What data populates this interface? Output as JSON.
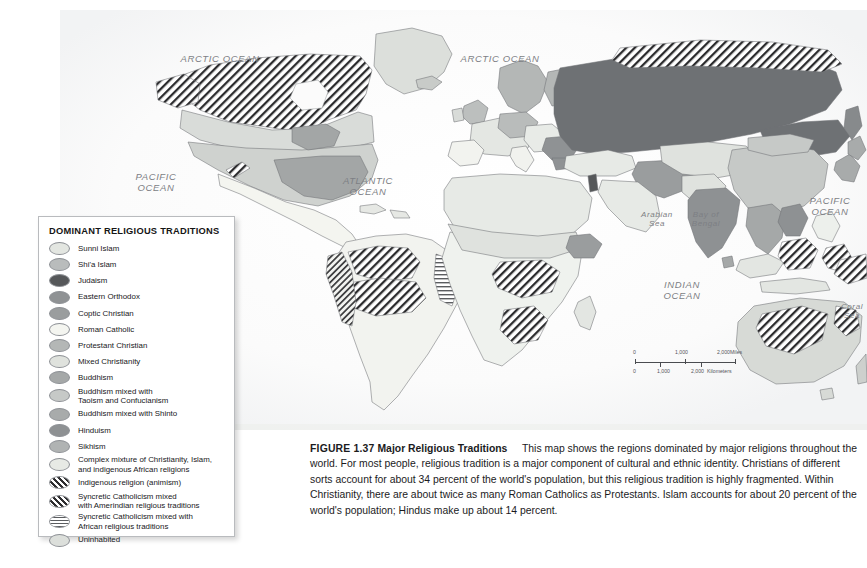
{
  "figure": {
    "number": "FIGURE 1.37",
    "title": "Major Religious Traditions",
    "body": "This map shows the regions dominated by major religions throughout the world. For most people, religious tradition is a major component of cultural and ethnic identity. Christians of different sorts account for about 34 percent of the world's population, but this religious tradition is highly fragmented. Within Christianity, there are about twice as many Roman Catholics as Protestants. Islam accounts for about 20 percent of the world's population; Hindus make up about 14 percent."
  },
  "legend": {
    "title": "DOMINANT RELIGIOUS TRADITIONS",
    "items": [
      {
        "label": "Sunni Islam",
        "fill": "#e3e6e1",
        "pattern": "solid"
      },
      {
        "label": "Shi'a Islam",
        "fill": "#b9bcbc",
        "pattern": "solid"
      },
      {
        "label": "Judaism",
        "fill": "#56585a",
        "pattern": "solid"
      },
      {
        "label": "Eastern Orthodox",
        "fill": "#8f9294",
        "pattern": "solid"
      },
      {
        "label": "Coptic Christian",
        "fill": "#9a9d9e",
        "pattern": "solid"
      },
      {
        "label": "Roman Catholic",
        "fill": "#f4f5f0",
        "pattern": "solid"
      },
      {
        "label": "Protestant Christian",
        "fill": "#b4b7b6",
        "pattern": "solid"
      },
      {
        "label": "Mixed Christianity",
        "fill": "#dfe2dd",
        "pattern": "solid"
      },
      {
        "label": "Buddhism",
        "fill": "#a5a8a8",
        "pattern": "solid"
      },
      {
        "label": "Buddhism mixed with\nTaoism and Confucianism",
        "fill": "#c6c9c7",
        "pattern": "solid"
      },
      {
        "label": "Buddhism mixed with Shinto",
        "fill": "#a8abab",
        "pattern": "solid"
      },
      {
        "label": "Hinduism",
        "fill": "#8e9193",
        "pattern": "solid"
      },
      {
        "label": "Sikhism",
        "fill": "#b0b3b3",
        "pattern": "solid"
      },
      {
        "label": "Complex mixture of Christianity, Islam,\nand indigenous African religions",
        "fill": "#e7eae5",
        "pattern": "solid"
      },
      {
        "label": "Indigenous religion (animism)",
        "fill": "#ffffff",
        "pattern": "diagonal-hatch"
      },
      {
        "label": "Syncretic Catholicism mixed\nwith Amerindian religious traditions",
        "fill": "#ffffff",
        "pattern": "diagonal-hatch"
      },
      {
        "label": "Syncretic Catholicism mixed with\nAfrican religious traditions",
        "fill": "#ffffff",
        "pattern": "horizontal-hatch"
      },
      {
        "label": "Uninhabited",
        "fill": "#dcdfdb",
        "pattern": "solid"
      }
    ]
  },
  "ocean_labels": [
    {
      "id": "arctic-ocean-west",
      "text": "ARCTIC OCEAN",
      "x": 160,
      "y": 44,
      "size": "major"
    },
    {
      "id": "arctic-ocean-east",
      "text": "ARCTIC OCEAN",
      "x": 440,
      "y": 44,
      "size": "major"
    },
    {
      "id": "pacific-ocean-west",
      "text": "PACIFIC\nOCEAN",
      "x": 96,
      "y": 162,
      "size": "major"
    },
    {
      "id": "atlantic-ocean",
      "text": "ATLANTIC\nOCEAN",
      "x": 308,
      "y": 166,
      "size": "major"
    },
    {
      "id": "pacific-ocean-east",
      "text": "PACIFIC\nOCEAN",
      "x": 770,
      "y": 186,
      "size": "major"
    },
    {
      "id": "indian-ocean",
      "text": "INDIAN\nOCEAN",
      "x": 622,
      "y": 270,
      "size": "major"
    },
    {
      "id": "arabian-sea",
      "text": "Arabian\nSea",
      "x": 597,
      "y": 200,
      "size": "minor"
    },
    {
      "id": "bay-of-bengal",
      "text": "Bay of\nBengal",
      "x": 646,
      "y": 200,
      "size": "minor"
    },
    {
      "id": "coral-sea",
      "text": "Coral\nSea",
      "x": 792,
      "y": 292,
      "size": "minor"
    }
  ],
  "scale_bar": {
    "miles": {
      "ticks": [
        "0",
        "1,000",
        "2,000"
      ],
      "unit": "Miles"
    },
    "kilometers": {
      "ticks": [
        "0",
        "1,000",
        "2,000"
      ],
      "unit": "Kilometers"
    }
  },
  "colors": {
    "sunni_islam": "#e3e6e1",
    "shia_islam": "#b9bcbc",
    "judaism": "#56585a",
    "eastern_orthodox": "#8f9294",
    "roman_catholic": "#f4f5f0",
    "protestant": "#b4b7b6",
    "buddhism": "#a5a8a8",
    "hinduism": "#8e9193",
    "complex_mixture": "#e7eae5",
    "outline": "#6f7276",
    "ocean_text": "#7d7f84"
  }
}
